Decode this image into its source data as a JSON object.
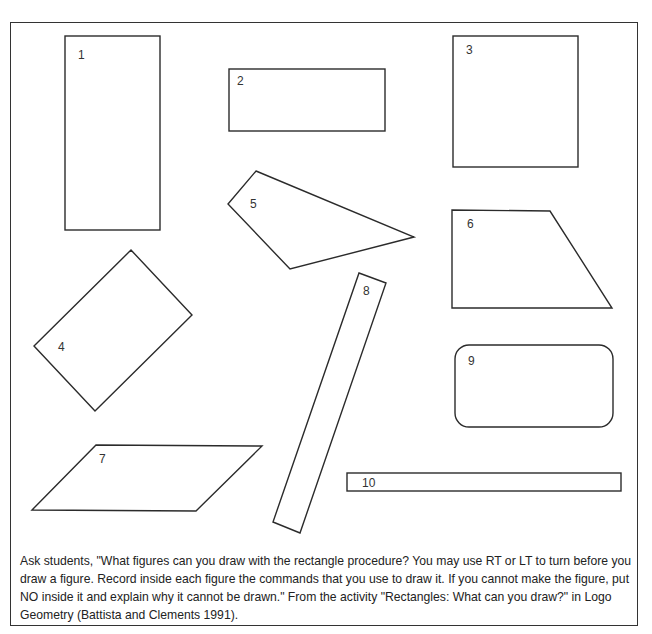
{
  "figures": [
    {
      "id": "1",
      "label": "1",
      "kind": "rectangle"
    },
    {
      "id": "2",
      "label": "2",
      "kind": "rectangle"
    },
    {
      "id": "3",
      "label": "3",
      "kind": "square"
    },
    {
      "id": "4",
      "label": "4",
      "kind": "rotated-rectangle"
    },
    {
      "id": "5",
      "label": "5",
      "kind": "quadrilateral"
    },
    {
      "id": "6",
      "label": "6",
      "kind": "trapezoid"
    },
    {
      "id": "7",
      "label": "7",
      "kind": "parallelogram"
    },
    {
      "id": "8",
      "label": "8",
      "kind": "rotated-thin-rectangle"
    },
    {
      "id": "9",
      "label": "9",
      "kind": "rounded-rectangle"
    },
    {
      "id": "10",
      "label": "10",
      "kind": "thin-rectangle"
    }
  ],
  "caption": "Ask students, \"What figures can you draw with the rectangle procedure? You may use RT or LT to turn before you draw a figure. Record inside each figure the commands that you use to draw it. If you cannot make the figure, put NO inside it and explain why it cannot be drawn.\" From the activity \"Rectangles: What can you draw?\" in Logo Geometry (Battista and Clements 1991)."
}
